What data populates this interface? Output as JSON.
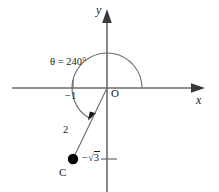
{
  "figure": {
    "kind": "coordinate-plane-angle-diagram",
    "width": 219,
    "height": 192,
    "background_color": "#ffffff",
    "line_color": "#6b6b6b",
    "text_color": "#1a1a1a",
    "point_color": "#000000"
  },
  "axes": {
    "x_label": "x",
    "y_label": "y",
    "origin_label": "O",
    "x_axis_y_px": 88,
    "y_axis_x_px": 107,
    "x_axis_start_px": 12,
    "x_axis_end_px": 205,
    "y_axis_top_px": 10,
    "y_axis_bottom_px": 192
  },
  "ticks": [
    {
      "id": "tick-neg-one",
      "axis": "x",
      "label": "−1",
      "value": -1,
      "position_px": 73
    },
    {
      "id": "tick-neg-sqrt3",
      "axis": "y",
      "label_prefix": "−",
      "label_radical": "√",
      "label_radicand": "3",
      "label": "−√3",
      "value": -1.732,
      "position_px": 159
    }
  ],
  "angle": {
    "label": "θ = 240°",
    "symbol": "θ",
    "degrees": 240,
    "arc_radius_px": 35,
    "sweep": "counterclockwise",
    "start_degrees": 0,
    "end_degrees": 240,
    "has_arrowhead": true
  },
  "terminal_ray": {
    "length_label": "2",
    "length_value": 2,
    "from_x_px": 107,
    "from_y_px": 88,
    "to_x_px": 73,
    "to_y_px": 159
  },
  "point": {
    "label": "C",
    "x_px": 73,
    "y_px": 159,
    "radius_px": 5,
    "coordinates": [
      -1,
      -1.732
    ]
  }
}
